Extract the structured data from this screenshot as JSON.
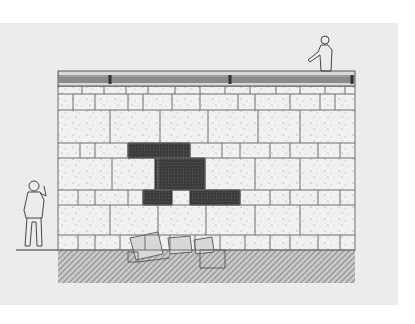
{
  "drawing": {
    "subject": "Stone wall elevation with repaired section",
    "colors": {
      "sheet": "#ececec",
      "stone_fill": "#f1f1f1",
      "joint": "#6e6e6e",
      "repair_fill": "#3c3c3c",
      "ground_hatch": "#7a7a7a",
      "coping": "#8a8a8a"
    }
  },
  "wall": {
    "x": 58,
    "right": 355,
    "coping": {
      "top": 71,
      "bottom": 86,
      "joints": [
        110,
        230,
        352
      ]
    },
    "courses": [
      {
        "name": "cap-course",
        "top": 86,
        "bottom": 94,
        "joints": [
          82,
          104,
          126,
          148,
          175,
          200,
          225,
          250,
          276,
          300,
          325,
          345
        ]
      },
      {
        "name": "course-a",
        "top": 94,
        "bottom": 110,
        "joints": [
          73,
          95,
          128,
          143,
          172,
          200,
          238,
          255,
          290,
          320,
          335
        ]
      },
      {
        "name": "course-b",
        "top": 110,
        "bottom": 143,
        "joints": [
          110,
          160,
          208,
          258,
          300
        ]
      },
      {
        "name": "course-c",
        "top": 143,
        "bottom": 158,
        "joints": [
          80,
          95,
          128,
          190,
          222,
          240,
          270,
          290,
          318,
          340
        ]
      },
      {
        "name": "course-d",
        "top": 158,
        "bottom": 190,
        "joints": [
          112,
          158,
          205,
          255,
          300
        ]
      },
      {
        "name": "course-e",
        "top": 190,
        "bottom": 205,
        "joints": [
          78,
          95,
          128,
          143,
          240,
          270,
          290,
          318,
          340
        ]
      },
      {
        "name": "course-f",
        "top": 205,
        "bottom": 235,
        "joints": [
          110,
          158,
          206,
          255,
          300
        ]
      },
      {
        "name": "course-g",
        "top": 235,
        "bottom": 250,
        "joints": [
          78,
          95,
          120,
          145,
          170,
          195,
          220,
          245,
          270,
          290,
          318,
          340
        ]
      }
    ],
    "repair_polygon": "128,143 190,143 190,158 205,158 205,190 240,190 240,205 190,205 190,190 172,190 172,205 143,205 143,190 155,190 155,158 128,158"
  },
  "ground": {
    "top": 250,
    "bottom": 283,
    "x": 58,
    "right": 355
  },
  "figures": [
    {
      "name": "person-left",
      "x": 22,
      "y": 178
    },
    {
      "name": "person-on-wall",
      "x": 313,
      "y": 33
    }
  ]
}
